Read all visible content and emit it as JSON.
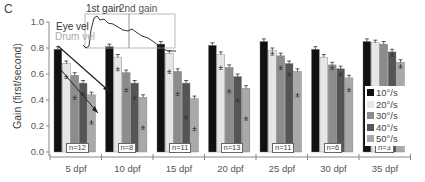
{
  "panel_label": "C",
  "chart_data": {
    "type": "bar",
    "title": "",
    "xlabel": "",
    "ylabel": "Gain (first/second)",
    "ylim": [
      0,
      1.0
    ],
    "yticks": [
      "0.0",
      "0.2",
      "0.4",
      "0.6",
      "0.8",
      "1.0"
    ],
    "grid": false,
    "legend_position": "inside-right",
    "categories": [
      "5 dpf",
      "10 dpf",
      "15 dpf",
      "20 dpf",
      "25 dpf",
      "30 dpf",
      "35 dpf"
    ],
    "n_labels": [
      "n=12",
      "n=8",
      "n=11",
      "n=13",
      "n=11",
      "n=6",
      "n=3"
    ],
    "series": [
      {
        "name": "10°/s",
        "color": "#111111",
        "first_gain": [
          0.79,
          0.81,
          0.83,
          0.82,
          0.85,
          0.79,
          0.85
        ],
        "second_gain": [
          0.78,
          0.8,
          0.82,
          0.81,
          0.84,
          0.78,
          0.84
        ]
      },
      {
        "name": "20°/s",
        "color": "#e6e6e6",
        "first_gain": [
          0.68,
          0.73,
          0.76,
          0.75,
          0.78,
          0.73,
          0.84
        ],
        "second_gain": [
          0.58,
          0.64,
          0.62,
          0.65,
          0.76,
          0.72,
          0.83
        ]
      },
      {
        "name": "30°/s",
        "color": "#8c8c8c",
        "first_gain": [
          0.59,
          0.61,
          0.62,
          0.65,
          0.74,
          0.67,
          0.83
        ],
        "second_gain": [
          0.42,
          0.48,
          0.45,
          0.47,
          0.65,
          0.65,
          0.82
        ]
      },
      {
        "name": "40°/s",
        "color": "#555555",
        "first_gain": [
          0.53,
          0.53,
          0.53,
          0.58,
          0.68,
          0.64,
          0.77
        ],
        "second_gain": [
          0.45,
          0.42,
          0.27,
          0.4,
          0.6,
          0.6,
          0.75
        ]
      },
      {
        "name": "50°/s",
        "color": "#a9a9a9",
        "first_gain": [
          0.44,
          0.42,
          0.41,
          0.49,
          0.62,
          0.57,
          0.69
        ],
        "second_gain": [
          0.23,
          0.19,
          0.18,
          0.26,
          0.44,
          0.48,
          0.66
        ]
      }
    ],
    "inset": {
      "labels": [
        "1st gain",
        "2nd gain"
      ],
      "traces": [
        "Eye vel",
        "Drum vel"
      ]
    }
  }
}
